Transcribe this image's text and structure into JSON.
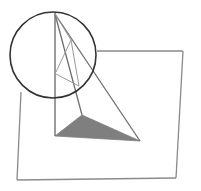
{
  "figure": {
    "colors": {
      "background": "#ffffff",
      "plane_stroke": "#8a8a8a",
      "edge_stroke": "#6e6e6e",
      "thin_stroke": "#9a9a9a",
      "circle_stroke": "#333333",
      "shade_fill": "#7f7f7f"
    },
    "labels": []
  }
}
